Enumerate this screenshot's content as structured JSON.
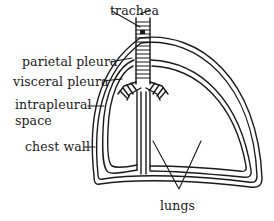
{
  "figure": {
    "line_color": "#1a1a1a",
    "background": "#ffffff"
  },
  "labels": {
    "trachea": "trachea",
    "parietal_pleura": "parietal pleura",
    "visceral_pleura": "visceral pleura",
    "intrapleural_line1": "intrapleural",
    "intrapleural_line2": "space",
    "chest_wall": "chest wall",
    "lungs": "lungs"
  }
}
